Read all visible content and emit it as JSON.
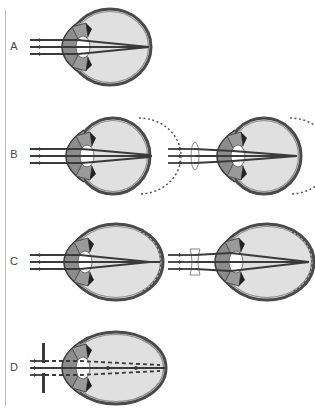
{
  "figure": {
    "colors": {
      "sclera": "#4a4a4a",
      "choroid": "#8c8c8c",
      "vitreous": "#e0e0e0",
      "rays": "#3a3a3a",
      "lens_outline": "#888888"
    },
    "rows": [
      {
        "label": "A",
        "panels": [
          {
            "name": "normal-eye",
            "correction": "none",
            "dashed_retina": "none"
          }
        ]
      },
      {
        "label": "B",
        "panels": [
          {
            "name": "hyperopic-eye",
            "correction": "none",
            "dashed_retina": "behind"
          },
          {
            "name": "hyperopic-eye-corrected",
            "correction": "convex-lens",
            "dashed_retina": "behind"
          }
        ]
      },
      {
        "label": "C",
        "panels": [
          {
            "name": "myopic-eye",
            "correction": "none",
            "dashed_retina": "inside"
          },
          {
            "name": "myopic-eye-corrected",
            "correction": "concave-lens",
            "dashed_retina": "inside"
          }
        ]
      },
      {
        "label": "D",
        "panels": [
          {
            "name": "astigmatic-eye-slit",
            "correction": "stenopeic-slit",
            "dashed_retina": "none"
          }
        ]
      }
    ]
  }
}
